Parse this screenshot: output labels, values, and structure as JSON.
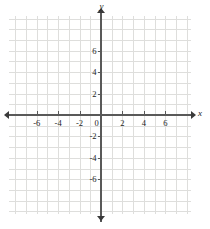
{
  "chart_data": {
    "type": "scatter",
    "title": "",
    "xlabel": "x",
    "ylabel": "y",
    "series": [],
    "x": [],
    "values": [],
    "grid": true,
    "legend": "none",
    "xlim": [
      -8,
      8
    ],
    "ylim": [
      -9,
      9
    ],
    "x_tick_labels": [
      "-6",
      "-4",
      "-2",
      "2",
      "4",
      "6"
    ],
    "x_tick_values": [
      -6,
      -4,
      -2,
      2,
      4,
      6
    ],
    "y_tick_labels": [
      "6",
      "4",
      "2",
      "-2",
      "-4",
      "-6"
    ],
    "y_tick_values": [
      6,
      4,
      2,
      -2,
      -4,
      -6
    ],
    "origin_label": "0",
    "x_minor_step": 1,
    "y_minor_step": 1,
    "grid_color": "#dededc",
    "axis_color": "#595959",
    "background_color": "#ffffff"
  },
  "axes": {
    "x_axis_name": "x",
    "y_axis_name": "y",
    "origin": "0"
  },
  "x_labels": [
    {
      "text": "-6",
      "value": -6
    },
    {
      "text": "-4",
      "value": -4
    },
    {
      "text": "-2",
      "value": -2
    },
    {
      "text": "2",
      "value": 2
    },
    {
      "text": "4",
      "value": 4
    },
    {
      "text": "6",
      "value": 6
    }
  ],
  "y_labels": [
    {
      "text": "6",
      "value": 6
    },
    {
      "text": "4",
      "value": 4
    },
    {
      "text": "2",
      "value": 2
    },
    {
      "text": "-2",
      "value": -2
    },
    {
      "text": "-4",
      "value": -4
    },
    {
      "text": "-6",
      "value": -6
    }
  ]
}
